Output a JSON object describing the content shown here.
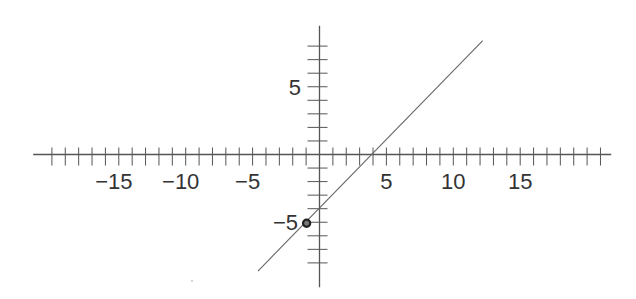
{
  "chart_data": {
    "type": "line",
    "title": "",
    "xlabel": "",
    "ylabel": "",
    "xlim": [
      -21.4,
      21.8
    ],
    "ylim": [
      -9.8,
      9.5
    ],
    "x_ticks": {
      "min": -20,
      "max": 21,
      "step": 1
    },
    "y_ticks": {
      "min": -8,
      "max": 8,
      "step": 1
    },
    "x_tick_labels": [
      "−15",
      "−10",
      "−5",
      "5",
      "10",
      "15"
    ],
    "x_tick_label_values": [
      -15,
      -10,
      -5,
      5,
      10,
      15
    ],
    "y_tick_labels": [
      "5",
      "−5"
    ],
    "y_tick_label_values": [
      5,
      -5
    ],
    "grid": false,
    "series": [
      {
        "name": "line",
        "equation": "y = x - 4",
        "slope": 1,
        "y_intercept": -4,
        "x_intercept": 4,
        "x": [
          -4.6,
          12.2
        ],
        "y": [
          -8.6,
          8.4
        ],
        "color": "#555555"
      }
    ],
    "points": [
      {
        "label": "",
        "x": -1,
        "y": -5,
        "style": "ring",
        "color": "#222222"
      }
    ]
  },
  "colors": {
    "axis": "#555555",
    "line": "#666666",
    "text": "#333333",
    "point": "#222222",
    "background": "#ffffff"
  }
}
